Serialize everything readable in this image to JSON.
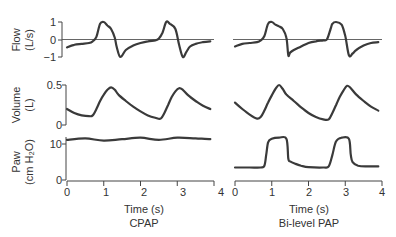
{
  "chart_data": [
    {
      "type": "line",
      "title": "CPAP",
      "xlabel": "Time (s)",
      "x_ticks": [
        "0",
        "1",
        "2",
        "3",
        "4"
      ],
      "xlim": [
        0,
        4
      ],
      "panels": [
        {
          "name": "Flow",
          "ylabel_line1": "Flow",
          "ylabel_line2": "(L/s)",
          "y_ticks": [
            "1",
            "0",
            "−1"
          ],
          "ylim": [
            -1,
            1
          ],
          "zero_line": true,
          "x": [
            0,
            0.2,
            0.4,
            0.6,
            0.7,
            0.8,
            0.9,
            1.0,
            1.1,
            1.2,
            1.3,
            1.35,
            1.45,
            1.6,
            1.8,
            2.0,
            2.2,
            2.4,
            2.5,
            2.6,
            2.7,
            2.8,
            2.95,
            3.05,
            3.15,
            3.25,
            3.35,
            3.5,
            3.7,
            3.9
          ],
          "y": [
            -0.45,
            -0.3,
            -0.25,
            -0.2,
            -0.1,
            0.15,
            0.9,
            1.0,
            0.8,
            0.6,
            0.1,
            -0.4,
            -1.0,
            -0.6,
            -0.35,
            -0.2,
            -0.1,
            -0.05,
            0.05,
            0.4,
            1.0,
            0.9,
            0.6,
            -0.3,
            -1.0,
            -0.7,
            -0.4,
            -0.25,
            -0.15,
            -0.1
          ]
        },
        {
          "name": "Volume",
          "ylabel_line1": "Volume",
          "ylabel_line2": "(L)",
          "y_ticks": [
            "0.5",
            "0"
          ],
          "ylim": [
            0,
            0.5
          ],
          "x": [
            0,
            0.2,
            0.4,
            0.6,
            0.7,
            0.8,
            0.9,
            1.0,
            1.1,
            1.2,
            1.3,
            1.4,
            1.6,
            1.8,
            2.0,
            2.2,
            2.4,
            2.55,
            2.65,
            2.75,
            2.85,
            2.95,
            3.05,
            3.15,
            3.3,
            3.5,
            3.7,
            3.9
          ],
          "y": [
            0.2,
            0.15,
            0.12,
            0.11,
            0.12,
            0.2,
            0.3,
            0.38,
            0.44,
            0.47,
            0.44,
            0.38,
            0.3,
            0.23,
            0.17,
            0.12,
            0.09,
            0.08,
            0.15,
            0.25,
            0.35,
            0.42,
            0.46,
            0.44,
            0.37,
            0.3,
            0.24,
            0.2
          ]
        },
        {
          "name": "Paw",
          "ylabel_line1": "Paw",
          "ylabel_line2": "(cm H₂O)",
          "y_ticks": [
            "10",
            "0"
          ],
          "ylim": [
            0,
            12
          ],
          "x": [
            0,
            0.5,
            1.0,
            1.5,
            2.0,
            2.5,
            3.0,
            3.5,
            3.9
          ],
          "y": [
            11.2,
            11.6,
            11.0,
            11.4,
            11.8,
            11.2,
            11.8,
            11.6,
            11.4
          ]
        }
      ]
    },
    {
      "type": "line",
      "title": "Bi-level PAP",
      "xlabel": "Time (s)",
      "x_ticks": [
        "0",
        "1",
        "2",
        "3",
        "4"
      ],
      "xlim": [
        0,
        4
      ],
      "panels": [
        {
          "name": "Flow",
          "ylim": [
            -1,
            1
          ],
          "zero_line": true,
          "x": [
            0,
            0.2,
            0.4,
            0.6,
            0.7,
            0.8,
            0.9,
            1.0,
            1.1,
            1.2,
            1.3,
            1.4,
            1.45,
            1.5,
            1.6,
            1.8,
            2.0,
            2.2,
            2.4,
            2.5,
            2.6,
            2.65,
            2.75,
            2.9,
            3.0,
            3.1,
            3.2,
            3.3,
            3.5,
            3.7,
            3.9
          ],
          "y": [
            -0.4,
            -0.25,
            -0.2,
            -0.15,
            -0.05,
            0.2,
            0.9,
            1.0,
            0.85,
            0.75,
            0.6,
            0.1,
            -0.9,
            -0.75,
            -0.6,
            -0.4,
            -0.2,
            -0.1,
            -0.05,
            0.0,
            0.6,
            0.9,
            1.0,
            0.85,
            0.2,
            -0.9,
            -0.8,
            -0.6,
            -0.35,
            -0.2,
            -0.15
          ]
        },
        {
          "name": "Volume",
          "ylim": [
            0,
            0.5
          ],
          "x": [
            0,
            0.2,
            0.4,
            0.6,
            0.7,
            0.8,
            0.9,
            1.0,
            1.1,
            1.2,
            1.3,
            1.4,
            1.6,
            1.8,
            2.0,
            2.2,
            2.4,
            2.55,
            2.65,
            2.75,
            2.85,
            2.95,
            3.05,
            3.15,
            3.3,
            3.5,
            3.7,
            3.9
          ],
          "y": [
            0.28,
            0.2,
            0.13,
            0.08,
            0.1,
            0.18,
            0.28,
            0.37,
            0.45,
            0.5,
            0.45,
            0.38,
            0.3,
            0.22,
            0.15,
            0.1,
            0.07,
            0.07,
            0.15,
            0.25,
            0.35,
            0.43,
            0.49,
            0.46,
            0.38,
            0.3,
            0.23,
            0.18
          ]
        },
        {
          "name": "Paw",
          "ylim": [
            0,
            12
          ],
          "x": [
            0,
            0.4,
            0.7,
            0.8,
            0.85,
            0.9,
            1.0,
            1.2,
            1.4,
            1.45,
            1.5,
            1.65,
            1.8,
            2.0,
            2.4,
            2.55,
            2.65,
            2.75,
            2.9,
            3.1,
            3.15,
            3.2,
            3.35,
            3.6,
            3.9
          ],
          "y": [
            3.5,
            3.5,
            3.5,
            4,
            7,
            10.5,
            11.5,
            11.8,
            11.5,
            6,
            5.2,
            4.5,
            4,
            3.6,
            3.5,
            3.8,
            7,
            10.8,
            11.8,
            11.5,
            7,
            5,
            4,
            3.8,
            3.8
          ]
        }
      ]
    }
  ]
}
